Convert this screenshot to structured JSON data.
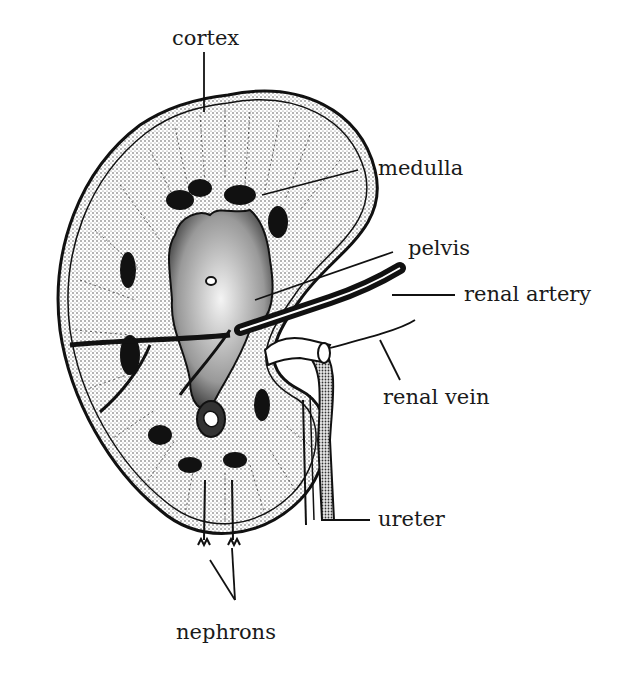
{
  "diagram": {
    "labels": {
      "cortex": "cortex",
      "medulla": "medulla",
      "pelvis": "pelvis",
      "renal_artery": "renal artery",
      "renal_vein": "renal vein",
      "ureter": "ureter",
      "nephrons": "nephrons"
    }
  }
}
